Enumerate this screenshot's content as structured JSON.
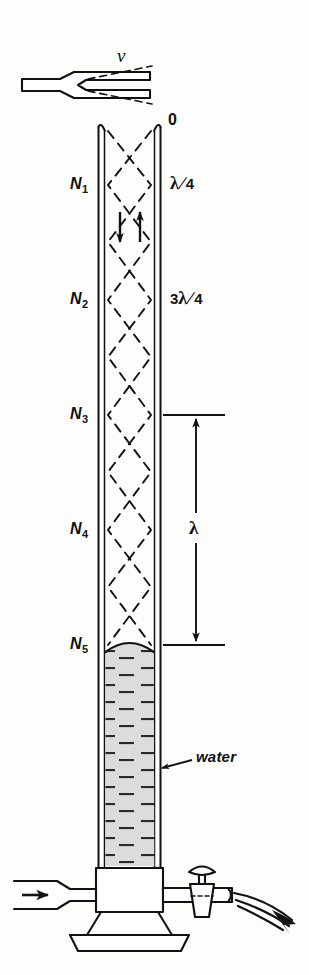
{
  "figure": {
    "background_color": "#fdfdfb",
    "ink_color": "#111111",
    "water_fill_color": "#d8d8d8"
  },
  "source": {
    "frequency_label": "ν",
    "tube_top_label": "0",
    "water_label": "water"
  },
  "nodes": [
    {
      "id": "N1",
      "base": "N",
      "sub": "1"
    },
    {
      "id": "N2",
      "base": "N",
      "sub": "2"
    },
    {
      "id": "N3",
      "base": "N",
      "sub": "3"
    },
    {
      "id": "N4",
      "base": "N",
      "sub": "4"
    },
    {
      "id": "N5",
      "base": "N",
      "sub": "5"
    }
  ],
  "length_labels": [
    {
      "id": "quarter",
      "numerator": "λ",
      "solidus": "/",
      "denominator": "4",
      "coefficient": ""
    },
    {
      "id": "three-quarter",
      "numerator": "λ",
      "solidus": "/",
      "denominator": "4",
      "coefficient": "3"
    }
  ],
  "dimension": {
    "label": "λ",
    "description": "full wavelength between N3 and N5"
  },
  "apparatus": {
    "inlet_label": "",
    "stopcock_label": "",
    "outlet_label": ""
  }
}
